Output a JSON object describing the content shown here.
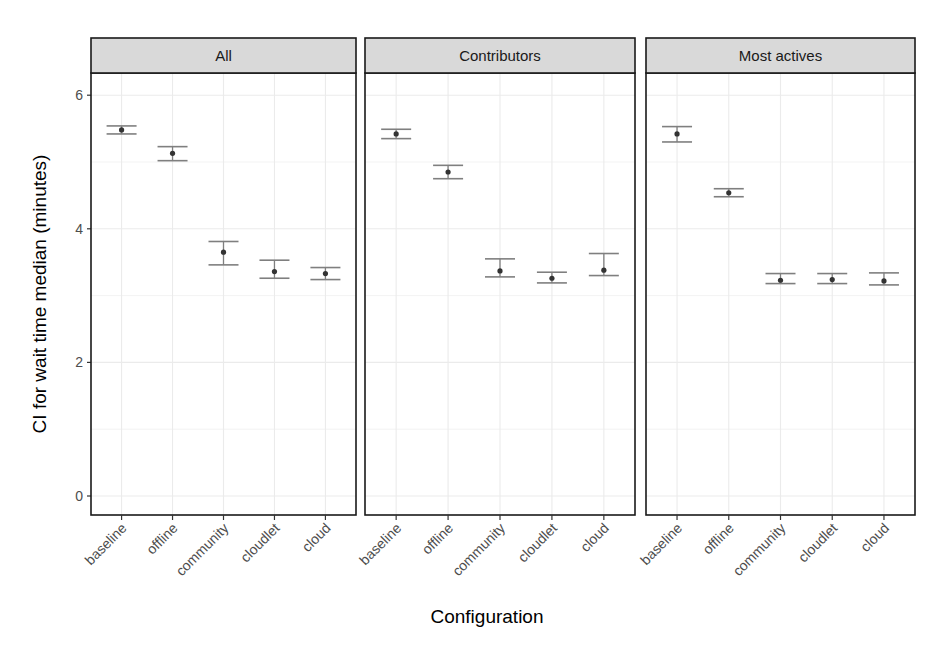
{
  "chart_data": {
    "type": "errorbar",
    "title": "",
    "xlabel": "Configuration",
    "ylabel": "CI for wait time median (minutes)",
    "ylim": [
      -0.3,
      6.6
    ],
    "yticks": [
      0,
      2,
      4,
      6
    ],
    "grid": true,
    "legend": null,
    "categories": [
      "baseline",
      "offline",
      "community",
      "cloudlet",
      "cloud"
    ],
    "facets": [
      {
        "name": "All",
        "points": [
          {
            "category": "baseline",
            "median": 5.48,
            "lower": 5.42,
            "upper": 5.54
          },
          {
            "category": "offline",
            "median": 5.13,
            "lower": 5.02,
            "upper": 5.23
          },
          {
            "category": "community",
            "median": 3.65,
            "lower": 3.46,
            "upper": 3.81
          },
          {
            "category": "cloudlet",
            "median": 3.36,
            "lower": 3.26,
            "upper": 3.53
          },
          {
            "category": "cloud",
            "median": 3.33,
            "lower": 3.24,
            "upper": 3.42
          }
        ]
      },
      {
        "name": "Contributors",
        "points": [
          {
            "category": "baseline",
            "median": 5.42,
            "lower": 5.35,
            "upper": 5.49
          },
          {
            "category": "offline",
            "median": 4.85,
            "lower": 4.75,
            "upper": 4.95
          },
          {
            "category": "community",
            "median": 3.37,
            "lower": 3.28,
            "upper": 3.55
          },
          {
            "category": "cloudlet",
            "median": 3.26,
            "lower": 3.19,
            "upper": 3.35
          },
          {
            "category": "cloud",
            "median": 3.38,
            "lower": 3.3,
            "upper": 3.63
          }
        ]
      },
      {
        "name": "Most actives",
        "points": [
          {
            "category": "baseline",
            "median": 5.42,
            "lower": 5.3,
            "upper": 5.53
          },
          {
            "category": "offline",
            "median": 4.54,
            "lower": 4.48,
            "upper": 4.6
          },
          {
            "category": "community",
            "median": 3.23,
            "lower": 3.18,
            "upper": 3.33
          },
          {
            "category": "cloudlet",
            "median": 3.24,
            "lower": 3.18,
            "upper": 3.33
          },
          {
            "category": "cloud",
            "median": 3.22,
            "lower": 3.16,
            "upper": 3.34
          }
        ]
      }
    ]
  },
  "colors": {
    "strip_bg": "#d9d9d9",
    "panel_border": "#1a1a1a",
    "grid": "#ebebeb",
    "errorbar": "#7f7f7f",
    "point": "#333333"
  }
}
